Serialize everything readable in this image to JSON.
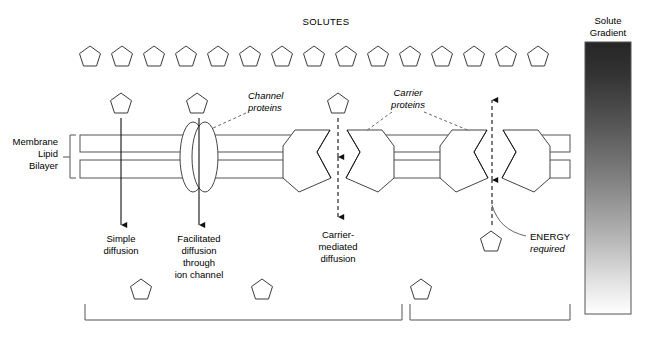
{
  "title": "SOLUTES",
  "labels": {
    "membrane": [
      "Membrane",
      "Lipid",
      "Bilayer"
    ],
    "channel_proteins": [
      "Channel",
      "proteins"
    ],
    "carrier_proteins": [
      "Carrier",
      "proteins"
    ],
    "simple_diffusion": [
      "Simple",
      "diffusion"
    ],
    "facilitated_diffusion": [
      "Facilitated",
      "diffusion",
      "through",
      "ion channel"
    ],
    "carrier_mediated": [
      "Carrier-",
      "mediated",
      "diffusion"
    ],
    "energy_word": "ENERGY",
    "energy_required": "required",
    "gradient_title": [
      "Solute",
      "Gradient"
    ]
  },
  "colors": {
    "stroke": "#1a1a1a",
    "membrane_stroke": "#555555",
    "solute_stroke": "#3a3a3a",
    "gradient_dark": "#262626",
    "gradient_light": "#ffffff",
    "background": "#ffffff"
  },
  "solutes": {
    "top_row_count": 15,
    "top_row_y": 57,
    "top_row_start_x": 90,
    "top_row_spacing": 32,
    "mid_row": [
      {
        "x": 98,
        "y": 104
      },
      {
        "x": 197,
        "y": 104
      },
      {
        "x": 338,
        "y": 104
      }
    ],
    "bottom_row": [
      {
        "x": 141,
        "y": 290
      },
      {
        "x": 262,
        "y": 290
      },
      {
        "x": 421,
        "y": 290
      },
      {
        "x": 491,
        "y": 242
      }
    ]
  },
  "membrane": {
    "left": 80,
    "right": 570,
    "band_top_y": 135,
    "band_top_h": 17,
    "band_bottom_y": 160,
    "band_bottom_h": 18
  },
  "transport_modes": [
    {
      "name": "simple-diffusion",
      "arrow_x": 121,
      "direction": "down",
      "style": "solid",
      "protein": "none"
    },
    {
      "name": "facilitated-diffusion",
      "arrow_x": 197,
      "direction": "down",
      "style": "solid",
      "protein": "channel-ellipse"
    },
    {
      "name": "carrier-mediated-diffusion",
      "arrow_x": 338,
      "direction": "down",
      "style": "dashed",
      "protein": "carrier-pair"
    },
    {
      "name": "active-transport",
      "arrow_x": 492,
      "direction": "up",
      "style": "dashed",
      "protein": "carrier-pair"
    }
  ],
  "brackets": {
    "left": {
      "x1": 85,
      "x2": 402,
      "y": 312
    },
    "right": {
      "x1": 410,
      "x2": 570,
      "y": 312
    }
  },
  "gradient_bar": {
    "x": 585,
    "y": 38,
    "width": 46,
    "height": 276,
    "top_color": "#262626",
    "bottom_color": "#ffffff"
  }
}
